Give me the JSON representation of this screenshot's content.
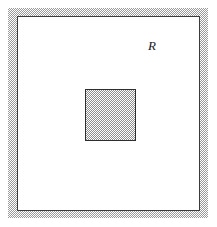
{
  "figure": {
    "background_color": "#ffffff",
    "width": 217,
    "height": 227
  },
  "outer_region": {
    "label": "R",
    "label_position": {
      "x": 148,
      "y": 39
    },
    "border_style": "hatched-band",
    "band_color": "#9a9a9a",
    "band_thickness_px": 9,
    "rule_color": "#3b3b3b",
    "fill_color": "#ffffff",
    "bounds": {
      "x": 8,
      "y": 8,
      "width": 200,
      "height": 210
    }
  },
  "inner_square": {
    "label": "",
    "fill_style": "stipple-hatch",
    "fill_color": "#8e8e8e",
    "border_color": "#2e2e2e",
    "bounds": {
      "x": 85,
      "y": 89,
      "width": 51,
      "height": 52
    }
  }
}
